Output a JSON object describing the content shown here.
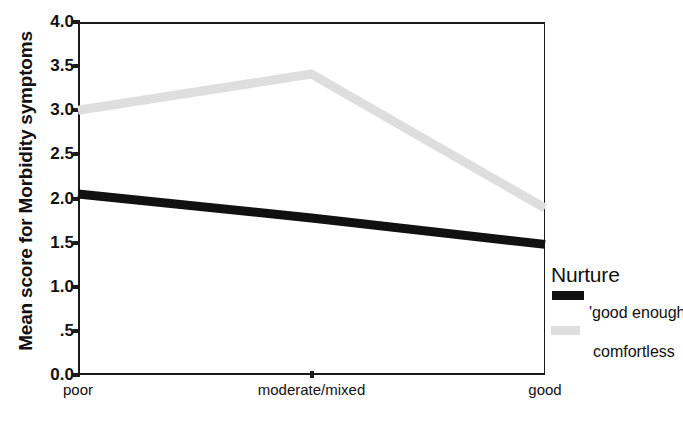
{
  "chart_data": {
    "type": "line",
    "title": "",
    "xlabel": "",
    "ylabel": "Mean score for Morbidity symptoms",
    "categories": [
      "poor",
      "moderate/mixed",
      "good"
    ],
    "ylim": [
      0.0,
      4.0
    ],
    "ytick_labels": [
      "4.0",
      "3.5",
      "3.0",
      "2.5",
      "2.0",
      "1.5",
      "1.0",
      ".5",
      "0.0"
    ],
    "ytick_values": [
      4.0,
      3.5,
      3.0,
      2.5,
      2.0,
      1.5,
      1.0,
      0.5,
      0.0
    ],
    "grid": false,
    "legend_position": "right",
    "legend_title": "Nurture",
    "series": [
      {
        "name": "'good enough'",
        "color": "#111111",
        "values": [
          2.05,
          1.78,
          1.48
        ]
      },
      {
        "name": "comfortless",
        "color": "#dedede",
        "values": [
          3.0,
          3.41,
          1.89
        ]
      }
    ]
  },
  "axes": {
    "y_title": "Mean score for Morbidity symptoms",
    "y_ticks": [
      "4.0",
      "3.5",
      "3.0",
      "2.5",
      "2.0",
      "1.5",
      "1.0",
      ".5",
      "0.0"
    ],
    "x_ticks": [
      "poor",
      "moderate/mixed",
      "good"
    ]
  },
  "legend": {
    "title": "Nurture",
    "entries": [
      {
        "label": "'good enough'",
        "swatch": "dark"
      },
      {
        "label": "comfortless",
        "swatch": "light"
      }
    ]
  }
}
